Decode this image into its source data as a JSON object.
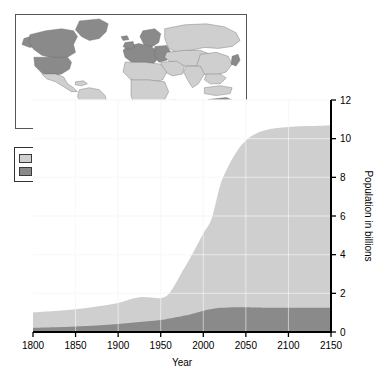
{
  "figure": {
    "background_color": "#ffffff"
  },
  "map_inset": {
    "name": "world-map-inset",
    "ocean_color": "#ffffff",
    "more_developed_color": "#8a8a8a",
    "less_developed_color": "#cfcfcf",
    "border_color": "#555555",
    "region_names": [
      "North America",
      "Greenland",
      "South America",
      "Europe",
      "Africa",
      "Asia",
      "Russia",
      "Japan",
      "Australia",
      "New Zealand"
    ]
  },
  "legend": {
    "entries": [
      {
        "label": "Less-developed countries",
        "color": "#cfcfcf"
      },
      {
        "label": "More-developed countries",
        "color": "#8a8a8a"
      }
    ]
  },
  "chart_data": {
    "type": "area",
    "stacked": true,
    "title": "",
    "xlabel": "Year",
    "ylabel": "Population in billions",
    "xlim": [
      1800,
      2150
    ],
    "ylim": [
      0,
      12
    ],
    "xticks": [
      1800,
      1850,
      1900,
      1950,
      2000,
      2050,
      2100,
      2150
    ],
    "xtick_labels": [
      "1800",
      "1850",
      "1900",
      "1950",
      "2000",
      "2050",
      "2100",
      "2150"
    ],
    "yticks": [
      0,
      2,
      4,
      6,
      8,
      10,
      12
    ],
    "ytick_labels": [
      "0",
      "2",
      "4",
      "6",
      "8",
      "10",
      "12"
    ],
    "y_axis_side": "right",
    "grid": true,
    "grid_color": "#f2f2f2",
    "x": [
      1800,
      1825,
      1850,
      1875,
      1900,
      1925,
      1950,
      1960,
      1970,
      1975,
      1980,
      1990,
      2000,
      2010,
      2020,
      2030,
      2040,
      2050,
      2060,
      2075,
      2100,
      2125,
      2150
    ],
    "series": [
      {
        "name": "More-developed countries",
        "color": "#8a8a8a",
        "values": [
          0.21,
          0.24,
          0.28,
          0.34,
          0.42,
          0.52,
          0.62,
          0.7,
          0.78,
          0.82,
          0.86,
          0.97,
          1.1,
          1.19,
          1.25,
          1.27,
          1.28,
          1.28,
          1.27,
          1.26,
          1.25,
          1.25,
          1.25
        ]
      },
      {
        "name": "Less-developed countries",
        "color": "#cfcfcf",
        "values": [
          0.8,
          0.84,
          0.9,
          0.98,
          1.08,
          1.28,
          1.13,
          1.3,
          1.92,
          2.28,
          2.6,
          3.3,
          4.0,
          4.7,
          6.35,
          7.35,
          8.1,
          8.62,
          8.95,
          9.2,
          9.35,
          9.4,
          9.45
        ]
      }
    ],
    "totals": [
      1.01,
      1.08,
      1.18,
      1.32,
      1.5,
      1.8,
      1.75,
      2.0,
      2.7,
      3.1,
      3.46,
      4.27,
      5.1,
      5.89,
      7.6,
      8.62,
      9.38,
      9.9,
      10.22,
      10.46,
      10.6,
      10.65,
      10.7
    ],
    "annotations": []
  },
  "plot_geometry": {
    "left_px": 33,
    "right_px": 331,
    "top_px": 100,
    "bottom_px": 332,
    "axis_color": "#000000"
  }
}
